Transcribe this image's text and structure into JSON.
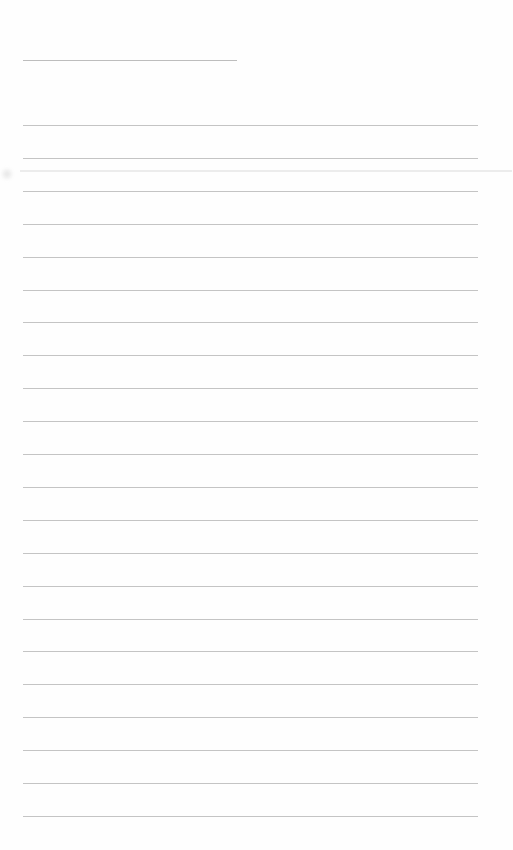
{
  "page": {
    "type": "blank lined notebook page",
    "background_color": "#fefefe",
    "rule_color": "#c4c4c4",
    "title_rule": {
      "x": 23,
      "y": 60,
      "width": 214
    },
    "rules": {
      "x": 23,
      "width": 455,
      "start_y": 125,
      "spacing": 32.9,
      "count": 22
    }
  }
}
